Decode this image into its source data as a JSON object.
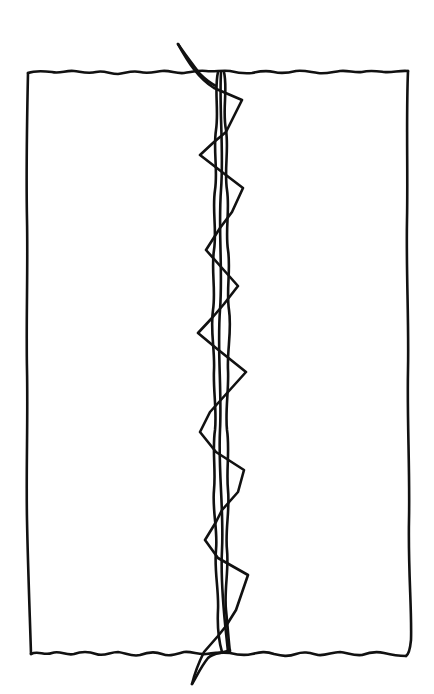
{
  "diagram": {
    "ink_color": "#111111",
    "background_color": "#ffffff",
    "elements": {
      "fabric": {
        "shape": "rectangle",
        "edges": "wavy top and bottom, slightly wobbly sides"
      },
      "seam": {
        "shape": "two parallel vertical lines",
        "position": "center"
      },
      "zigzag_stitch": {
        "shape": "zigzag",
        "orientation": "vertical",
        "crosses_seam": true
      },
      "thread_tails": [
        "top-left tail above fabric",
        "bottom-left tail below fabric"
      ]
    }
  }
}
